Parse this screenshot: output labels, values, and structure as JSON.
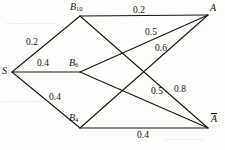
{
  "diagram": {
    "type": "network-flow-graph",
    "stroke_color": "#1a1713",
    "nodes": [
      {
        "id": "S",
        "label": "S",
        "sub": "",
        "overbar": false,
        "x": 12,
        "y": 72,
        "label_x": 2,
        "label_y": 66
      },
      {
        "id": "B10",
        "label": "B",
        "sub": "10",
        "overbar": false,
        "x": 80,
        "y": 16,
        "label_x": 70,
        "label_y": 2
      },
      {
        "id": "B6",
        "label": "B",
        "sub": "6",
        "overbar": false,
        "x": 80,
        "y": 72,
        "label_x": 69,
        "label_y": 58
      },
      {
        "id": "B4",
        "label": "B",
        "sub": "4",
        "overbar": false,
        "x": 80,
        "y": 128,
        "label_x": 69,
        "label_y": 113
      },
      {
        "id": "A",
        "label": "A",
        "sub": "",
        "overbar": false,
        "x": 208,
        "y": 15,
        "label_x": 210,
        "label_y": 3
      },
      {
        "id": "Abar",
        "label": "A",
        "sub": "",
        "overbar": true,
        "x": 208,
        "y": 128,
        "label_x": 211,
        "label_y": 113
      }
    ],
    "edges": [
      {
        "from": "S",
        "to": "B10",
        "weight": "0.2",
        "label_x": 26,
        "label_y": 38
      },
      {
        "from": "S",
        "to": "B6",
        "weight": "0.4",
        "label_x": 37,
        "label_y": 59
      },
      {
        "from": "S",
        "to": "B4",
        "weight": "0.4",
        "label_x": 49,
        "label_y": 93
      },
      {
        "from": "B10",
        "to": "A",
        "weight": "0.2",
        "label_x": 133,
        "label_y": 6
      },
      {
        "from": "B10",
        "to": "Abar",
        "weight": "0.5",
        "label_x": 151,
        "label_y": 87
      },
      {
        "from": "B6",
        "to": "A",
        "weight": "0.5",
        "label_x": 145,
        "label_y": 28
      },
      {
        "from": "B6",
        "to": "Abar",
        "weight": "0.8",
        "label_x": 174,
        "label_y": 85
      },
      {
        "from": "B4",
        "to": "A",
        "weight": "0.6",
        "label_x": 155,
        "label_y": 44
      },
      {
        "from": "B4",
        "to": "Abar",
        "weight": "0.4",
        "label_x": 137,
        "label_y": 131
      }
    ],
    "bleed_marks": [
      {
        "text": "—————",
        "x": 6,
        "y": 18
      },
      {
        "text": "————",
        "x": 4,
        "y": 60
      },
      {
        "text": "—————",
        "x": 2,
        "y": 96
      },
      {
        "text": "———",
        "x": 172,
        "y": 20
      },
      {
        "text": "————",
        "x": 164,
        "y": 134
      }
    ]
  }
}
